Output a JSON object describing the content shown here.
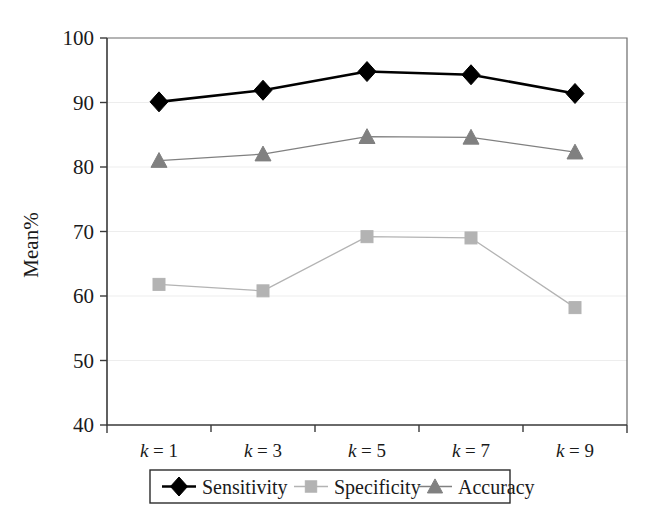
{
  "chart_data": {
    "type": "line",
    "title": "",
    "xlabel": "",
    "ylabel": "Mean%",
    "categories": [
      "k = 1",
      "k = 3",
      "k = 5",
      "k = 7",
      "k = 9"
    ],
    "category_parts": [
      {
        "var": "k",
        "eq": " = ",
        "val": "1"
      },
      {
        "var": "k",
        "eq": " = ",
        "val": "3"
      },
      {
        "var": "k",
        "eq": " = ",
        "val": "5"
      },
      {
        "var": "k",
        "eq": " = ",
        "val": "7"
      },
      {
        "var": "k",
        "eq": " = ",
        "val": "9"
      }
    ],
    "ylim": [
      40,
      100
    ],
    "yticks": [
      40,
      50,
      60,
      70,
      80,
      90,
      100
    ],
    "ytick_labels": [
      "40",
      "50",
      "60",
      "70",
      "80",
      "90",
      "100"
    ],
    "grid": true,
    "legend_position": "bottom",
    "series": [
      {
        "name": "Sensitivity",
        "marker": "diamond",
        "color": "#000000",
        "line_width": 2.6,
        "values": [
          90.1,
          91.9,
          94.8,
          94.3,
          91.4
        ]
      },
      {
        "name": "Specificity",
        "marker": "square",
        "color": "#b3b3b3",
        "line_width": 1.3,
        "values": [
          61.8,
          60.8,
          69.2,
          69.0,
          58.2
        ]
      },
      {
        "name": "Accuracy",
        "marker": "triangle",
        "color": "#808080",
        "line_width": 1.3,
        "values": [
          81.0,
          82.0,
          84.7,
          84.6,
          82.3
        ]
      }
    ]
  },
  "legend": {
    "items": [
      {
        "label": "Sensitivity"
      },
      {
        "label": "Specificity"
      },
      {
        "label": "Accuracy"
      }
    ]
  }
}
